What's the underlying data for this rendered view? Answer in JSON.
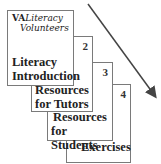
{
  "diagram": {
    "cards": [
      {
        "number": "",
        "logo_mark": "VA",
        "logo_line1": "Literacy",
        "logo_line2": "Volunteers",
        "title_line1": "Literacy",
        "title_line2": "Introduction"
      },
      {
        "number": "2",
        "title_line1": "Resources",
        "title_line2": "for Tutors"
      },
      {
        "number": "3",
        "title_line1": "Resources",
        "title_line2": "for Students"
      },
      {
        "number": "4",
        "title_line1": "Exercises",
        "title_line2": ""
      }
    ],
    "arrow": {
      "direction": "down-right",
      "color": "#444444"
    }
  }
}
